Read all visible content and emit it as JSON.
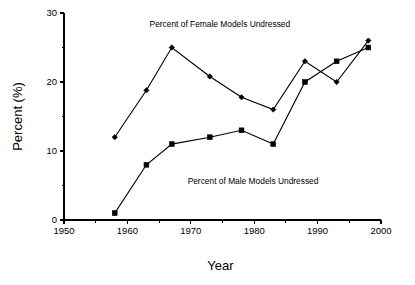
{
  "chart_data": {
    "type": "line",
    "title": "",
    "xlabel": "Year",
    "ylabel": "Percent (%)",
    "xlim": [
      1950,
      2000
    ],
    "ylim": [
      0,
      30
    ],
    "grid": false,
    "legend_position": "inline-annotations",
    "x_major_ticks": [
      1950,
      1960,
      1970,
      1980,
      1990,
      2000
    ],
    "x_minor_ticks": [
      1955,
      1965,
      1975,
      1985,
      1995
    ],
    "y_major_ticks": [
      0,
      10,
      20,
      30
    ],
    "y_minor_ticks": [
      5,
      15,
      25
    ],
    "x_tick_labels": [
      "1950",
      "1960",
      "1970",
      "1980",
      "1990",
      "2000"
    ],
    "y_tick_labels": [
      "0",
      "10",
      "20",
      "30"
    ],
    "series": [
      {
        "name": "Percent of Female Models Undressed",
        "marker": "diamond",
        "color": "#000000",
        "x": [
          1958,
          1963,
          1967,
          1973,
          1978,
          1983,
          1988,
          1993,
          1998
        ],
        "values": [
          12,
          18.8,
          25,
          20.8,
          17.8,
          16,
          23,
          20,
          26
        ]
      },
      {
        "name": "Percent of Male Models Undressed",
        "marker": "square",
        "color": "#000000",
        "x": [
          1958,
          1963,
          1967,
          1973,
          1978,
          1983,
          1988,
          1993,
          1998
        ],
        "values": [
          1,
          8,
          11,
          12,
          13,
          11,
          20,
          23,
          25
        ]
      }
    ],
    "annotations": [
      {
        "text": "Percent of Female Models Undressed",
        "x": 1963.5,
        "y": 28.0
      },
      {
        "text": "Percent of Male Models Undressed",
        "x": 1969.5,
        "y": 5.2
      }
    ]
  },
  "axes": {
    "x_title": "Year",
    "y_title": "Percent (%)"
  }
}
